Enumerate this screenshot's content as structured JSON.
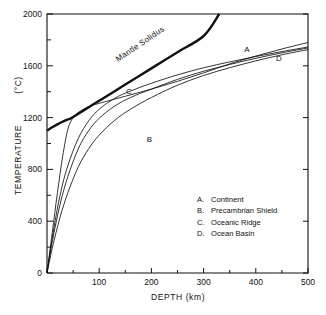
{
  "chart_data": {
    "type": "line",
    "title": "",
    "xlabel": "DEPTH  (km)",
    "ylabel": "TEMPERATURE  (°C)",
    "xlim": [
      0,
      500
    ],
    "ylim": [
      0,
      2000
    ],
    "grid": false,
    "x_major_ticks": [
      0,
      100,
      200,
      300,
      400,
      500
    ],
    "x_tick_labels": [
      "0",
      "100",
      "200",
      "300",
      "400",
      "500"
    ],
    "x_minor_ticks": [
      50,
      150,
      250,
      350,
      450
    ],
    "y_major_ticks": [
      0,
      400,
      800,
      1200,
      1600,
      2000
    ],
    "y_tick_labels": [
      "0",
      "400",
      "800",
      "1200",
      "1600",
      "2000"
    ],
    "y_minor_ticks": [
      200,
      600,
      1000,
      1400,
      1800
    ],
    "legend_position": "lower-right",
    "series": [
      {
        "name": "A",
        "label": "Continent",
        "annotation": "A",
        "annotation_at": [
          383,
          1705
        ],
        "x": [
          0,
          10,
          25,
          40,
          60,
          80,
          100,
          130,
          160,
          200,
          250,
          300,
          350,
          400,
          450,
          500
        ],
        "y": [
          0,
          270,
          600,
          830,
          1040,
          1175,
          1265,
          1350,
          1405,
          1465,
          1530,
          1585,
          1630,
          1672,
          1710,
          1745
        ]
      },
      {
        "name": "B",
        "label": "Precambrian Shield",
        "annotation": "B",
        "annotation_at": [
          196,
          1010
        ],
        "x": [
          0,
          10,
          25,
          40,
          60,
          80,
          100,
          130,
          160,
          200,
          250,
          300,
          350,
          400,
          450,
          500
        ],
        "y": [
          0,
          190,
          430,
          620,
          820,
          960,
          1065,
          1180,
          1265,
          1355,
          1450,
          1525,
          1585,
          1638,
          1685,
          1725
        ]
      },
      {
        "name": "C",
        "label": "Oceanic Ridge",
        "annotation": "C",
        "annotation_at": [
          157,
          1380
        ],
        "x": [
          0,
          10,
          20,
          30,
          40,
          50,
          60,
          80,
          100,
          150,
          200,
          250,
          300,
          350,
          400,
          450,
          500
        ],
        "y": [
          0,
          310,
          620,
          900,
          1110,
          1200,
          1240,
          1285,
          1310,
          1365,
          1420,
          1480,
          1545,
          1615,
          1675,
          1730,
          1780
        ]
      },
      {
        "name": "D",
        "label": "Ocean Basin",
        "annotation": "D",
        "annotation_at": [
          444,
          1640
        ],
        "x": [
          0,
          10,
          25,
          40,
          60,
          80,
          100,
          130,
          160,
          200,
          250,
          300,
          350,
          400,
          450,
          500
        ],
        "y": [
          0,
          240,
          530,
          745,
          960,
          1100,
          1195,
          1290,
          1355,
          1420,
          1495,
          1558,
          1610,
          1658,
          1700,
          1738
        ]
      },
      {
        "name": "Mantle Solidus",
        "label": "Mantle Solidus",
        "annotation": "Mantle Solidus",
        "annotation_at": [
          150,
          1870
        ],
        "x": [
          0,
          10,
          20,
          30,
          40,
          50,
          100,
          150,
          200,
          250,
          300,
          330
        ],
        "y": [
          1100,
          1125,
          1148,
          1168,
          1186,
          1205,
          1330,
          1455,
          1580,
          1705,
          1830,
          2000
        ]
      }
    ]
  },
  "legend": {
    "entries": [
      {
        "key": "A.",
        "label": "Continent"
      },
      {
        "key": "B.",
        "label": "Precambrian Shield"
      },
      {
        "key": "C.",
        "label": "Oceanic Ridge"
      },
      {
        "key": "D.",
        "label": "Ocean Basin"
      }
    ]
  },
  "axes": {
    "x_title": "DEPTH  (km)",
    "y_title_main": "TEMPERATURE",
    "y_title_unit": "(°C)"
  },
  "annotations": {
    "solidus": "Mantle Solidus",
    "a": "A",
    "b": "B",
    "c": "C",
    "d": "D"
  },
  "colors": {
    "ink": "#111111",
    "background": "#ffffff"
  }
}
